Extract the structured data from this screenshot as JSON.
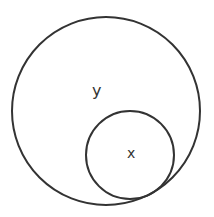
{
  "diagram": {
    "type": "venn-subset",
    "outer_circle": {
      "label": "y",
      "cx": 106,
      "cy": 111,
      "r": 94
    },
    "inner_circle": {
      "label": "x",
      "cx": 130,
      "cy": 155,
      "r": 44
    },
    "stroke_color": "#333333",
    "background": "#ffffff"
  }
}
